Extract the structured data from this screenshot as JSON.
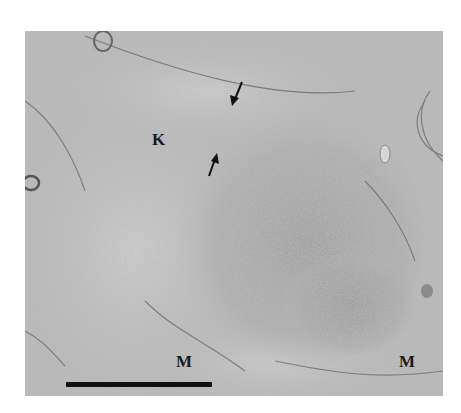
{
  "figure": {
    "type": "transmission electron micrograph",
    "labels": [
      {
        "text": "K",
        "x": 152,
        "y": 131
      },
      {
        "text": "M",
        "x": 176,
        "y": 353
      },
      {
        "text": "M",
        "x": 399,
        "y": 353
      }
    ],
    "arrows": [
      {
        "id": "upper",
        "from": [
          242,
          82
        ],
        "to": [
          233,
          104
        ],
        "direction": "down-left"
      },
      {
        "id": "lower",
        "from": [
          209,
          176
        ],
        "to": [
          216,
          155
        ],
        "direction": "up-right"
      }
    ],
    "scale_bar": {
      "x": 66,
      "y": 382,
      "width": 146,
      "height": 5
    },
    "colors": {
      "background": "#ffffff",
      "tissue_base": "#b7b7b7",
      "dense_region": "#a4a4a4",
      "granule": "#4a4a4a",
      "label": "#1a1a1a"
    }
  }
}
